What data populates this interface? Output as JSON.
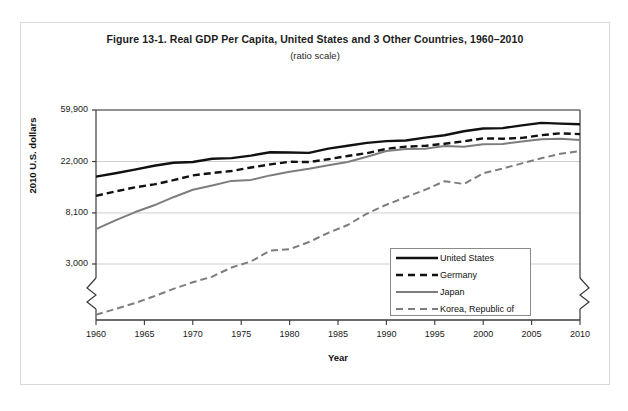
{
  "figure": {
    "title": "Figure 13-1. Real GDP Per Capita, United States and 3 Other Countries, 1960–2010",
    "subtitle": "(ratio scale)"
  },
  "colors": {
    "united_states": "#111111",
    "germany": "#111111",
    "japan": "#7d7d7d",
    "korea": "#7d7d7d",
    "gridline": "#d0d0d0",
    "axis": "#3a3a3a",
    "frame": "#d8d8d8"
  },
  "legend": {
    "position": "inside-bottom-right",
    "entries": [
      {
        "label": "United States",
        "style": "solid",
        "weight": "thick",
        "color": "#111111"
      },
      {
        "label": "Germany",
        "style": "dashed",
        "weight": "thick",
        "color": "#111111"
      },
      {
        "label": "Japan",
        "style": "solid",
        "weight": "medium",
        "color": "#7d7d7d"
      },
      {
        "label": "Korea, Republic of",
        "style": "dashed",
        "weight": "medium",
        "color": "#7d7d7d"
      }
    ]
  },
  "chart_data": {
    "type": "line",
    "title": "Figure 13-1. Real GDP Per Capita, United States and 3 Other Countries, 1960–2010",
    "subtitle": "(ratio scale)",
    "xlabel": "Year",
    "ylabel": "2010 U.S. dollars",
    "yscale": "log",
    "y_axis_break": true,
    "grid": "horizontal",
    "xlim": [
      1960,
      2010
    ],
    "ylim": [
      1000,
      59900
    ],
    "xticks": [
      1960,
      1965,
      1970,
      1975,
      1980,
      1985,
      1990,
      1995,
      2000,
      2005,
      2010
    ],
    "xtick_labels": [
      "1960",
      "1965",
      "1970",
      "1975",
      "1980",
      "1985",
      "1990",
      "1995",
      "2000",
      "2005",
      "2010"
    ],
    "yticks": [
      3000,
      8100,
      22000,
      59900
    ],
    "ytick_labels": [
      "3,000",
      "8,100",
      "22,000",
      "59,900"
    ],
    "x": [
      1960,
      1962,
      1964,
      1966,
      1968,
      1970,
      1972,
      1974,
      1976,
      1978,
      1980,
      1982,
      1984,
      1986,
      1988,
      1990,
      1992,
      1994,
      1996,
      1998,
      2000,
      2002,
      2004,
      2006,
      2008,
      2010
    ],
    "series": [
      {
        "name": "United States",
        "values": [
          16400,
          17500,
          18800,
          20300,
          21500,
          21800,
          23200,
          23500,
          24700,
          26300,
          26200,
          26000,
          28300,
          29900,
          31600,
          32700,
          33100,
          35000,
          36700,
          39600,
          41800,
          42100,
          44400,
          46600,
          46000,
          45400
        ]
      },
      {
        "name": "Germany",
        "values": [
          11300,
          12300,
          13300,
          14100,
          15300,
          16800,
          17600,
          18300,
          19600,
          20800,
          21900,
          21800,
          23000,
          24500,
          25900,
          28100,
          29400,
          29800,
          31100,
          32600,
          34500,
          34300,
          34800,
          36700,
          38100,
          37500
        ]
      },
      {
        "name": "Japan",
        "values": [
          5900,
          7000,
          8200,
          9400,
          11000,
          12700,
          13800,
          15100,
          15400,
          16800,
          18000,
          19100,
          20500,
          21800,
          24100,
          27000,
          28100,
          28200,
          29800,
          29300,
          30800,
          30900,
          32400,
          33900,
          34300,
          33500
        ]
      },
      {
        "name": "Korea, Republic of",
        "values": [
          1120,
          1250,
          1400,
          1600,
          1850,
          2100,
          2350,
          2800,
          3150,
          3900,
          4000,
          4600,
          5500,
          6400,
          8000,
          9500,
          11000,
          12700,
          15000,
          14200,
          17500,
          19200,
          21200,
          23400,
          25600,
          27000
        ]
      }
    ]
  }
}
